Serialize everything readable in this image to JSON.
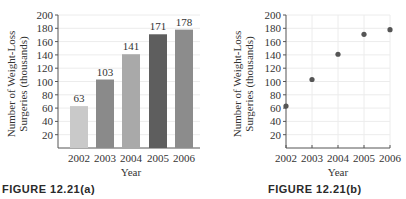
{
  "chart_data": [
    {
      "type": "bar",
      "title": "",
      "caption": "FIGURE 12.21(a)",
      "xlabel": "Year",
      "ylabel": "Number of Weight-Loss Surgeries (thousands)",
      "ylabel_line1": "Number of Weight-Loss",
      "ylabel_line2": "Surgeries (thousands)",
      "categories": [
        "2002",
        "2003",
        "2004",
        "2005",
        "2006"
      ],
      "values": [
        63,
        103,
        141,
        171,
        178
      ],
      "data_labels": [
        "63",
        "103",
        "141",
        "171",
        "178"
      ],
      "bar_colors": [
        "#c9c9c9",
        "#8a8a8a",
        "#a9a9a9",
        "#5e5e5e",
        "#8c8c8c"
      ],
      "yticks": [
        20,
        40,
        60,
        80,
        100,
        120,
        140,
        160,
        180,
        200
      ],
      "ylim": [
        0,
        200
      ],
      "grid": true
    },
    {
      "type": "scatter",
      "title": "",
      "caption": "FIGURE 12.21(b)",
      "xlabel": "Year",
      "ylabel": "Number of Weight-Loss Surgeries (thousands)",
      "ylabel_line1": "Number of Weight-Loss",
      "ylabel_line2": "Surgeries (thousands)",
      "x": [
        2002,
        2003,
        2004,
        2005,
        2006
      ],
      "y": [
        63,
        103,
        141,
        171,
        178
      ],
      "xticks": [
        "2002",
        "2003",
        "2004",
        "2005",
        "2006"
      ],
      "yticks": [
        20,
        40,
        60,
        80,
        100,
        120,
        140,
        160,
        180,
        200
      ],
      "ylim": [
        0,
        200
      ],
      "xlim": [
        2002,
        2006
      ],
      "marker_color": "#555555",
      "grid": true
    }
  ]
}
